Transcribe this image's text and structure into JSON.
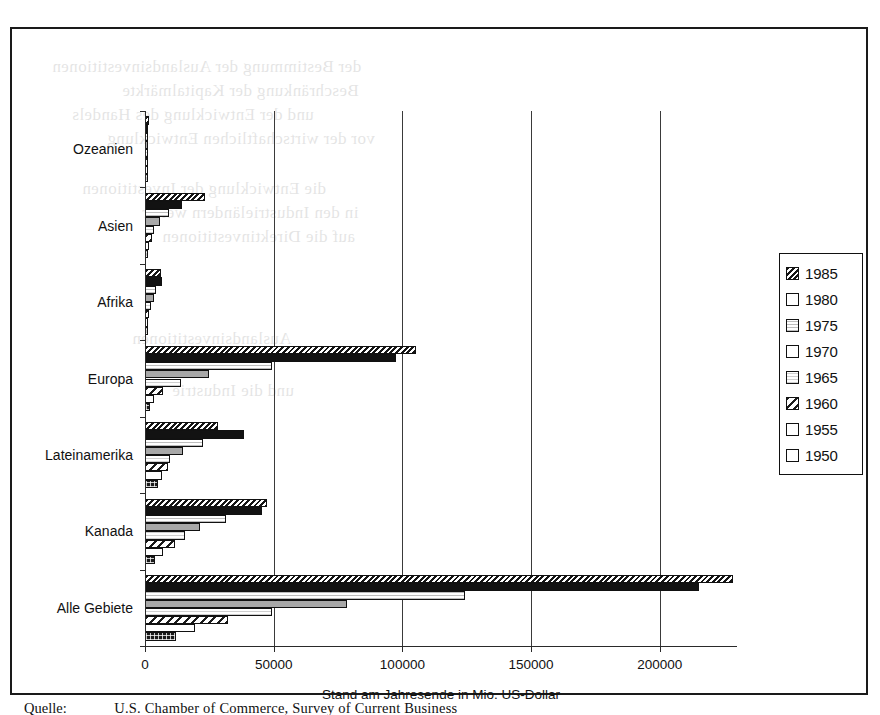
{
  "chart_data": {
    "type": "bar",
    "orientation": "horizontal",
    "title": "",
    "xlabel": "Stand am Jahresende in Mio. US-Dollar",
    "ylabel": "",
    "xlim": [
      0,
      230000
    ],
    "xticks": [
      0,
      50000,
      100000,
      150000,
      200000
    ],
    "xtick_labels": [
      "0",
      "50000",
      "100000",
      "150000",
      "200000"
    ],
    "grid": "vertical",
    "legend_position": "right-outside",
    "categories": [
      "Ozeanien",
      "Asien",
      "Afrika",
      "Europa",
      "Lateinamerika",
      "Kanada",
      "Alle Gebiete"
    ],
    "series": [
      {
        "name": "1985",
        "values": [
          1200,
          23000,
          5800,
          105000,
          28000,
          47000,
          228000
        ]
      },
      {
        "name": "1980",
        "values": [
          900,
          14000,
          6100,
          97000,
          38000,
          45000,
          215000
        ]
      },
      {
        "name": "1975",
        "values": [
          600,
          9000,
          4000,
          49000,
          22000,
          31000,
          124000
        ]
      },
      {
        "name": "1970",
        "values": [
          450,
          5500,
          3000,
          24500,
          14500,
          21000,
          78000
        ]
      },
      {
        "name": "1965",
        "values": [
          300,
          3000,
          1900,
          13700,
          9500,
          15000,
          49000
        ]
      },
      {
        "name": "1960",
        "values": [
          200,
          2300,
          1100,
          6700,
          8400,
          11200,
          32000
        ]
      },
      {
        "name": "1955",
        "values": [
          120,
          1200,
          650,
          3000,
          6100,
          6500,
          19000
        ]
      },
      {
        "name": "1950",
        "values": [
          90,
          900,
          300,
          1700,
          4600,
          3600,
          11800
        ]
      }
    ]
  },
  "legend": {
    "items": [
      {
        "label": "1985",
        "pattern": "dense-diagonal-hatch-dark"
      },
      {
        "label": "1980",
        "pattern": "solid-black"
      },
      {
        "label": "1975",
        "pattern": "fine-dot-light"
      },
      {
        "label": "1970",
        "pattern": "solid-grey"
      },
      {
        "label": "1965",
        "pattern": "fine-dot-very-light"
      },
      {
        "label": "1960",
        "pattern": "wide-diagonal-hatch"
      },
      {
        "label": "1955",
        "pattern": "checker-dot"
      },
      {
        "label": "1950",
        "pattern": "solid-dark-with-dots"
      }
    ]
  },
  "caption": {
    "label": "Quelle:",
    "source": "U.S. Chamber of Commerce, Survey of Current Business"
  },
  "bleed_text": [
    "der Bestimmung der Auslandsinvestitionen",
    "Beschränkung der Kapitalmärkte",
    "und der Entwicklung des Handels",
    "vor der wirtschaftlichen Entwicklung",
    "die Entwicklung der Investitionen",
    "in den Industrieländern weiter",
    "auf die Direktinvestitionen",
    "Auslandsinvestitionen",
    "und die Industrie"
  ],
  "colors": {
    "frame": "#1a1a1a",
    "axis": "#2a2a2a",
    "grid": "#3a3a3a",
    "text": "#111111",
    "background": "#ffffff"
  }
}
